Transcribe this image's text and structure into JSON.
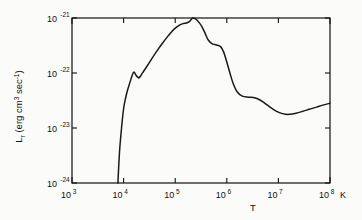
{
  "figure": {
    "background_color": "#fbfbf9",
    "ink_color": "#111111",
    "frame": {
      "left": 72,
      "top": 18,
      "right": 330,
      "bottom": 183
    }
  },
  "axes": {
    "x": {
      "title": "T",
      "unit_label": "K",
      "scale": "log",
      "tick_mantissa": "10",
      "ticks": [
        {
          "label": "10",
          "exponent": "3",
          "value": 1000
        },
        {
          "label": "10",
          "exponent": "4",
          "value": 10000
        },
        {
          "label": "10",
          "exponent": "5",
          "value": 100000
        },
        {
          "label": "10",
          "exponent": "6",
          "value": 1000000
        },
        {
          "label": "10",
          "exponent": "7",
          "value": 10000000
        },
        {
          "label": "10",
          "exponent": "8",
          "value": 100000000
        }
      ]
    },
    "y": {
      "title_main": "L",
      "title_sub": "r",
      "title_rest": " (erg cm",
      "title_exp1": "3",
      "title_mid": " sec",
      "title_exp2": "-1",
      "title_close": ")",
      "title_plain": "L_r (erg cm3 sec-1)",
      "scale": "log",
      "ticks": [
        {
          "label": "10",
          "exponent": "-21",
          "value": 1e-21
        },
        {
          "label": "10",
          "exponent": "-22",
          "value": 1e-22
        },
        {
          "label": "10",
          "exponent": "-23",
          "value": 1e-23
        },
        {
          "label": "10",
          "exponent": "-24",
          "value": 1e-24
        }
      ]
    }
  },
  "chart_data": {
    "type": "line",
    "title": "",
    "subtitle": "",
    "xlabel": "T",
    "ylabel": "L_r (erg cm3 sec-1)",
    "xscale": "log",
    "yscale": "log",
    "xlim": [
      1000,
      100000000
    ],
    "ylim": [
      1e-24,
      1e-21
    ],
    "grid": false,
    "legend": "none",
    "annotations": [
      {
        "text": "K",
        "meaning": "temperature unit after last x tick"
      },
      {
        "text": "T",
        "meaning": "x axis title"
      }
    ],
    "series": [
      {
        "name": "radiative cooling function",
        "log_x": [
          3.89,
          3.92,
          3.96,
          4.0,
          4.04,
          4.08,
          4.12,
          4.16,
          4.2,
          4.24,
          4.28,
          4.3,
          4.34,
          4.4,
          4.48,
          4.56,
          4.66,
          4.76,
          4.86,
          4.94,
          5.02,
          5.1,
          5.16,
          5.22,
          5.28,
          5.34,
          5.4,
          5.46,
          5.52,
          5.58,
          5.64,
          5.72,
          5.8,
          5.88,
          5.94,
          6.0,
          6.06,
          6.12,
          6.2,
          6.3,
          6.42,
          6.54,
          6.66,
          6.78,
          6.9,
          7.02,
          7.14,
          7.22,
          7.34,
          7.46,
          7.6,
          7.74,
          7.88,
          8.0
        ],
        "log_y": [
          -24.0,
          -23.45,
          -23.0,
          -22.65,
          -22.45,
          -22.3,
          -22.18,
          -22.06,
          -21.98,
          -22.04,
          -22.08,
          -22.09,
          -22.04,
          -21.95,
          -21.84,
          -21.72,
          -21.58,
          -21.45,
          -21.33,
          -21.24,
          -21.17,
          -21.12,
          -21.1,
          -21.09,
          -21.06,
          -21.0,
          -21.02,
          -21.08,
          -21.16,
          -21.28,
          -21.4,
          -21.47,
          -21.49,
          -21.52,
          -21.62,
          -21.8,
          -22.0,
          -22.18,
          -22.34,
          -22.42,
          -22.44,
          -22.45,
          -22.5,
          -22.58,
          -22.66,
          -22.72,
          -22.75,
          -22.75,
          -22.73,
          -22.7,
          -22.66,
          -22.62,
          -22.58,
          -22.55
        ],
        "color": "#1a1a1a",
        "linewidth": 1.5,
        "style": "solid",
        "markers": "none"
      }
    ],
    "features": [
      {
        "name": "sharp rise onset",
        "log_T": 3.89,
        "log_L": -24.0
      },
      {
        "name": "hydrogen line bump local max",
        "log_T": 4.2,
        "log_L": -21.98
      },
      {
        "name": "local dip after bump",
        "log_T": 4.3,
        "log_L": -22.09
      },
      {
        "name": "broad plateau start",
        "log_T": 5.16,
        "log_L": -21.1
      },
      {
        "name": "global maximum",
        "log_T": 5.34,
        "log_L": -21.0
      },
      {
        "name": "shoulder before drop",
        "log_T": 5.8,
        "log_L": -21.49
      },
      {
        "name": "secondary shelf",
        "log_T": 6.42,
        "log_L": -22.44
      },
      {
        "name": "global minimum",
        "log_T": 7.2,
        "log_L": -22.75
      },
      {
        "name": "bremsstrahlung rise end",
        "log_T": 8.0,
        "log_L": -22.55
      }
    ]
  }
}
